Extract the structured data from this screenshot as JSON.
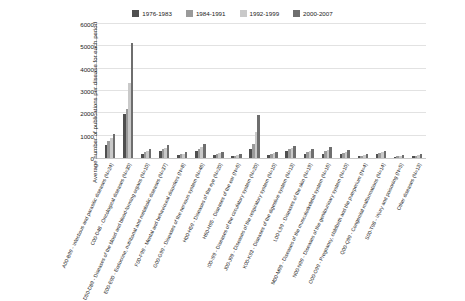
{
  "chart_data": {
    "type": "bar",
    "title": "",
    "xlabel": "",
    "ylabel": "Average number of publications per disease for each period",
    "ylim": [
      0,
      6000
    ],
    "yticks": [
      0,
      1000,
      2000,
      3000,
      4000,
      5000,
      6000
    ],
    "grid": true,
    "legend_position": "top-center",
    "categories": [
      "A00-B99 - Infectious and parasitic diseases (N=24)",
      "C00-D48 - Oncological diseases (N=30)",
      "D50-D89 - Diseases of the blood and blood-forming organs (N=10)",
      "E00-E90 - Endocrine, nutritional and metabolic diseases (N=37)",
      "F00-F99 - Mental and behavioural disorders (N=8)",
      "G00-G99 - Diseases of the nervous system (N=46)",
      "H00-H59 - Diseases of the eye (N=20)",
      "H60-H95 - Diseases of the ear (N=6)",
      "I00-I99 - Diseases of the circulatory system (N=20)",
      "J00-J99 - Diseases of the respiratory system (N=10)",
      "K00-K93 - Diseases of the digestive system (N=13)",
      "L00-L99 - Diseases of the skin (N=19)",
      "M00-M99 - Diseases of the musculoskeletal system (N=16)",
      "N00-N99 - Diseases of the genitourinary system (N=10)",
      "O00-O99 - Pregnancy, childbirth and the puerperium (N=4)",
      "Q00-Q99 - Congenital malformations (N=14)",
      "S00-T98 - Injury and poisoning (N=5)",
      "Other diseases (N=13)"
    ],
    "series": [
      {
        "name": "1976-1983",
        "color": "#4f4f4f",
        "values": [
          560,
          1950,
          190,
          300,
          120,
          300,
          130,
          80,
          420,
          120,
          300,
          200,
          200,
          180,
          70,
          170,
          60,
          80
        ]
      },
      {
        "name": "1984-1991",
        "color": "#9a9a9a",
        "values": [
          750,
          2180,
          260,
          380,
          160,
          420,
          180,
          110,
          640,
          170,
          380,
          260,
          300,
          230,
          110,
          220,
          90,
          110
        ]
      },
      {
        "name": "1992-1999",
        "color": "#c9c9c9",
        "values": [
          900,
          3350,
          300,
          450,
          200,
          500,
          220,
          130,
          1150,
          210,
          430,
          320,
          360,
          280,
          150,
          250,
          110,
          130
        ]
      },
      {
        "name": "2000-2007",
        "color": "#6e6e6e",
        "values": [
          1080,
          5100,
          400,
          560,
          250,
          620,
          280,
          160,
          1900,
          260,
          520,
          400,
          470,
          340,
          190,
          300,
          150,
          170
        ]
      }
    ]
  }
}
